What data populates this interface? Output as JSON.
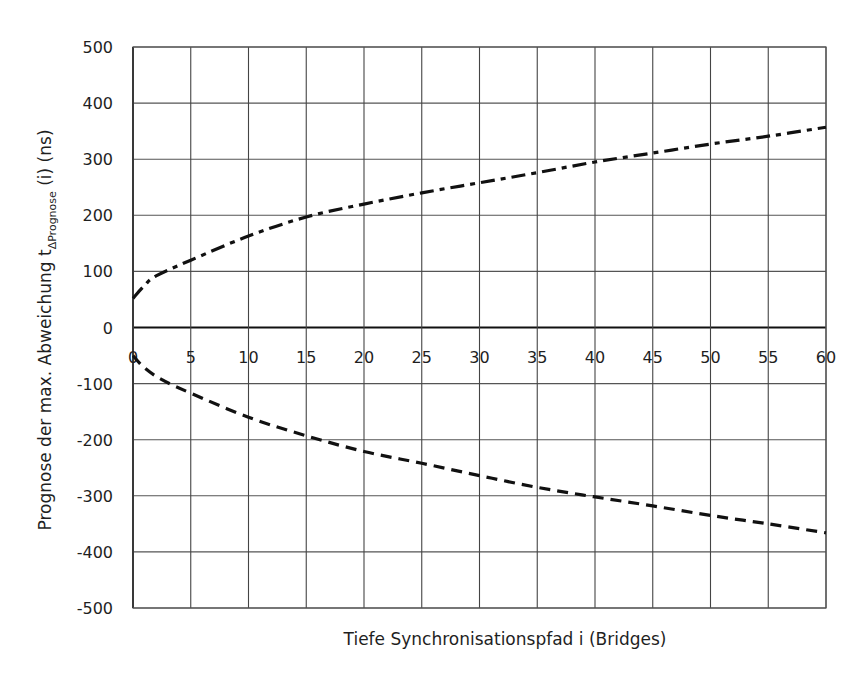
{
  "chart_data": {
    "type": "line",
    "title": "",
    "xlabel": "Tiefe Synchronisationspfad i (Bridges)",
    "ylabel": {
      "prefix": "Prognose der max. Abweichung t",
      "subscript": "ΔPrognose",
      "suffix": " (i) (ns)"
    },
    "xlim": [
      0,
      60
    ],
    "ylim": [
      -500,
      500
    ],
    "x_ticks": [
      0,
      5,
      10,
      15,
      20,
      25,
      30,
      35,
      40,
      45,
      50,
      55,
      60
    ],
    "y_ticks": [
      500,
      400,
      300,
      200,
      100,
      0,
      -100,
      -200,
      -300,
      -400,
      -500
    ],
    "grid": true,
    "legend": null,
    "series": [
      {
        "name": "upper bound",
        "style": "dash-dot",
        "color": "#111111",
        "x": [
          0,
          1,
          2,
          5,
          10,
          15,
          20,
          25,
          30,
          35,
          40,
          45,
          50,
          55,
          60
        ],
        "values": [
          52,
          75,
          92,
          120,
          163,
          197,
          220,
          240,
          258,
          276,
          295,
          311,
          327,
          341,
          357
        ]
      },
      {
        "name": "lower bound",
        "style": "dashed",
        "color": "#111111",
        "x": [
          0,
          1,
          2.5,
          5,
          10,
          15,
          20,
          25,
          30,
          35,
          40,
          45,
          50,
          55,
          60
        ],
        "values": [
          -50,
          -72,
          -93,
          -117,
          -160,
          -193,
          -221,
          -242,
          -264,
          -285,
          -302,
          -318,
          -335,
          -350,
          -366
        ]
      }
    ]
  }
}
